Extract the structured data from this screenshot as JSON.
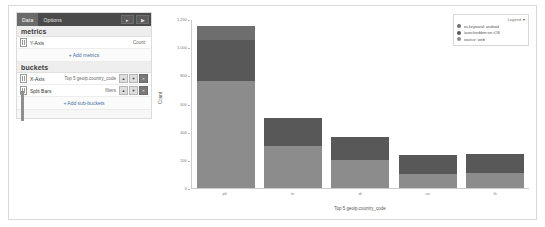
{
  "editor": {
    "tabs": [
      {
        "label": "Data",
        "active": true
      },
      {
        "label": "Options",
        "active": false
      }
    ],
    "header_buttons": [
      {
        "name": "collapse-button",
        "glyph": "▸"
      },
      {
        "name": "apply-button",
        "glyph": "▶"
      }
    ],
    "metrics": {
      "title": "metrics",
      "rows": [
        {
          "label": "Y-Axis",
          "value": "Count"
        }
      ],
      "add_label": "Add metrics",
      "add_plus": "+"
    },
    "buckets": {
      "title": "buckets",
      "rows": [
        {
          "label": "X-Axis",
          "value": "Top 5 geoip.country_code",
          "buttons": [
            {
              "name": "bucket-up-button",
              "glyph": "▲"
            },
            {
              "name": "bucket-down-button",
              "glyph": "▼"
            },
            {
              "name": "bucket-remove-button",
              "glyph": "×"
            }
          ]
        },
        {
          "label": "Split Bars",
          "value": "filters",
          "buttons": [
            {
              "name": "bucket-up-button",
              "glyph": "▲"
            },
            {
              "name": "bucket-down-button",
              "glyph": "▼"
            },
            {
              "name": "bucket-remove-button",
              "glyph": "×"
            }
          ]
        }
      ],
      "add_label": "Add sub-buckets",
      "add_plus": "+"
    }
  },
  "legend": {
    "title": "Legend",
    "caret": "▾",
    "items": [
      {
        "label": "os.keyword: android",
        "color": "#6e6e6e"
      },
      {
        "label": "launcherbbm:on iOS",
        "color": "#585858"
      },
      {
        "label": "source: web",
        "color": "#8c8c8c"
      }
    ]
  },
  "chart_data": {
    "type": "bar",
    "stacked": true,
    "title": "",
    "xlabel": "Top 5 geoip.country_code",
    "ylabel": "Count",
    "categories": [
      "ph",
      "in",
      "id",
      "us",
      "th"
    ],
    "ylim": [
      0,
      1200
    ],
    "yticks": [
      0,
      200,
      400,
      600,
      800,
      1000,
      1200
    ],
    "ytick_labels": [
      "0",
      "200",
      "400",
      "600",
      "800",
      "1,000",
      "1,200"
    ],
    "grid": false,
    "legend_position": "top-right",
    "series": [
      {
        "name": "source: web",
        "color": "#8c8c8c",
        "values": [
          760,
          300,
          200,
          100,
          105
        ]
      },
      {
        "name": "launcherbbm:on iOS",
        "color": "#585858",
        "values": [
          290,
          200,
          160,
          135,
          140
        ]
      },
      {
        "name": "os.keyword: android",
        "color": "#6e6e6e",
        "values": [
          100,
          0,
          0,
          0,
          0
        ]
      }
    ]
  }
}
